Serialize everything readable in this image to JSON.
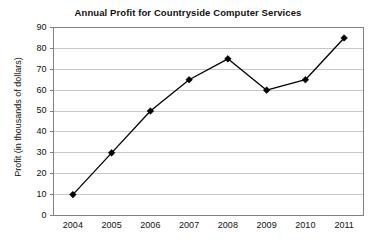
{
  "chart_data": {
    "type": "line",
    "title": "Annual Profit for Countryside Computer Services",
    "xlabel": "",
    "ylabel": "Profit (in thousands of dollars)",
    "categories": [
      "2004",
      "2005",
      "2006",
      "2007",
      "2008",
      "2009",
      "2010",
      "2011"
    ],
    "values": [
      10,
      30,
      50,
      65,
      75,
      60,
      65,
      85
    ],
    "ylim": [
      0,
      90
    ],
    "yticks": [
      0,
      10,
      20,
      30,
      40,
      50,
      60,
      70,
      80,
      90
    ],
    "ytick_labels": [
      "0",
      "10",
      "20",
      "30",
      "40",
      "50",
      "60",
      "70",
      "80",
      "90"
    ],
    "grid": "horizontal",
    "legend": "none",
    "series": [
      {
        "name": "Annual Profit",
        "values": [
          10,
          30,
          50,
          65,
          75,
          60,
          65,
          85
        ]
      }
    ],
    "colors": {
      "line": "#000000",
      "marker": "#000000",
      "gridline": "#c8c8c8",
      "frame": "#808080",
      "background": "#ffffff",
      "text": "#111111"
    },
    "marker_style": "diamond"
  }
}
